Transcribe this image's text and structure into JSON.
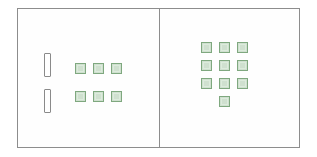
{
  "figure": {
    "name": "base-ten-counters-comparison",
    "background_color": "#ffffff",
    "frame": {
      "x": 17,
      "y": 8,
      "width": 283,
      "height": 140,
      "border_color": "#8d8d8d",
      "fill_color": "#fefefe"
    },
    "divider": {
      "x": 141,
      "color": "#8d8d8d"
    },
    "colors": {
      "unit_fill": "#cfe0cf",
      "unit_border": "#7fa87f",
      "unit_inner_highlight": "#dcebdc",
      "rod_fill": "#ffffff",
      "rod_border": "#8a8a8a",
      "frame_border": "#8d8d8d"
    }
  },
  "panels": [
    {
      "id": "left-panel",
      "name": "left-panel",
      "rod_count": 2,
      "unit_count": 6,
      "rod_size": {
        "width": 7,
        "height": 24
      },
      "unit_size": {
        "width": 11,
        "height": 11
      },
      "rods": [
        {
          "x": 26,
          "y": 44
        },
        {
          "x": 26,
          "y": 80
        }
      ],
      "units": [
        {
          "x": 57,
          "y": 54
        },
        {
          "x": 75,
          "y": 54
        },
        {
          "x": 93,
          "y": 54
        },
        {
          "x": 57,
          "y": 82
        },
        {
          "x": 75,
          "y": 82
        },
        {
          "x": 93,
          "y": 82
        }
      ]
    },
    {
      "id": "right-panel",
      "name": "right-panel",
      "rod_count": 0,
      "unit_count": 10,
      "unit_size": {
        "width": 11,
        "height": 11
      },
      "units": [
        {
          "x": 42,
          "y": 33
        },
        {
          "x": 60,
          "y": 33
        },
        {
          "x": 78,
          "y": 33
        },
        {
          "x": 42,
          "y": 51
        },
        {
          "x": 60,
          "y": 51
        },
        {
          "x": 78,
          "y": 51
        },
        {
          "x": 42,
          "y": 69
        },
        {
          "x": 60,
          "y": 69
        },
        {
          "x": 78,
          "y": 69
        },
        {
          "x": 60,
          "y": 87
        }
      ]
    }
  ]
}
